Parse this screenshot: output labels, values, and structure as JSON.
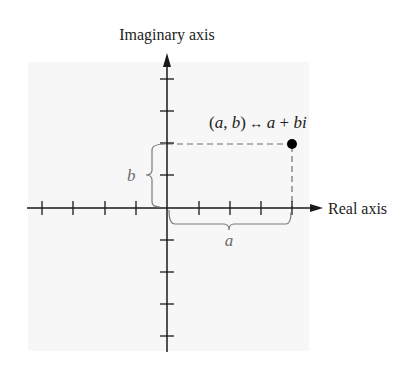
{
  "diagram": {
    "imaginary_axis_label": "Imaginary axis",
    "real_axis_label": "Real axis",
    "point_label": {
      "open": "(",
      "a": "a",
      "comma": ", ",
      "b": "b",
      "close": ")",
      "arrow": " ↔ ",
      "a2": "a",
      "plus": " + ",
      "bi": "bi"
    },
    "brace_a_label": "a",
    "brace_b_label": "b",
    "colors": {
      "background": "#ffffff",
      "panel": "#f7f7f7",
      "axis": "#1a1a1a",
      "dashed": "#707070",
      "brace": "#7a7a7a",
      "label_gray": "#6a6a6a",
      "text": "#222222",
      "point": "#000000"
    },
    "origin": [
      167,
      208
    ],
    "point": [
      292,
      144
    ],
    "tick_spacing": 31.25,
    "real_ticks": [
      -4,
      -3,
      -2,
      -1,
      1,
      2,
      3,
      4
    ],
    "imag_ticks": [
      4,
      3,
      2,
      1,
      -1,
      -2,
      -3,
      -4
    ]
  }
}
